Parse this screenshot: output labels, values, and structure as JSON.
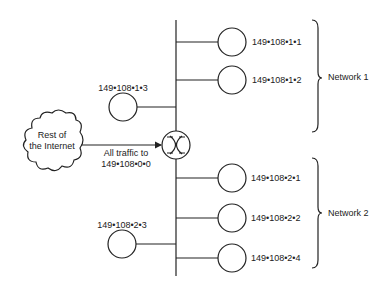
{
  "cloud": {
    "label_line1": "Rest of",
    "label_line2": "the Internet"
  },
  "arrow": {
    "label_line1": "All traffic to",
    "label_line2": "149•108•0•0"
  },
  "router": {
    "icon": "router-icon"
  },
  "network1": {
    "label": "Network 1",
    "hosts": [
      {
        "address": "149•108•1•1"
      },
      {
        "address": "149•108•1•2"
      },
      {
        "address": "149•108•1•3"
      }
    ]
  },
  "network2": {
    "label": "Network 2",
    "hosts": [
      {
        "address": "149•108•2•1"
      },
      {
        "address": "149•108•2•2"
      },
      {
        "address": "149•108•2•4"
      },
      {
        "address": "149•108•2•3"
      }
    ]
  },
  "colors": {
    "stroke": "#222222",
    "background": "#ffffff"
  }
}
